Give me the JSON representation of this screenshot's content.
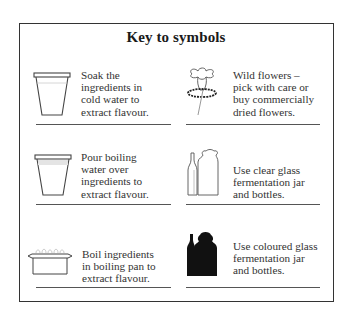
{
  "title": "Key to symbols",
  "entries": [
    {
      "icon": "cup-cold-water-icon",
      "text": "Soak the\ningredients in\ncold water to\nextract flavour."
    },
    {
      "icon": "wild-flower-icon",
      "text": "Wild flowers –\npick with care or\nbuy commercially\ndried flowers."
    },
    {
      "icon": "cup-boiling-water-icon",
      "text": "Pour boiling\nwater over\ningredients to\nextract flavour."
    },
    {
      "icon": "clear-glass-jar-and-bottle-icon",
      "text": "Use clear glass\nfermentation jar\nand bottles."
    },
    {
      "icon": "boiling-pan-icon",
      "text": "Boil ingredients\nin boiling pan to\nextract flavour."
    },
    {
      "icon": "coloured-glass-jar-and-bottle-icon",
      "text": "Use coloured glass\nfermentation jar\nand bottles."
    }
  ]
}
